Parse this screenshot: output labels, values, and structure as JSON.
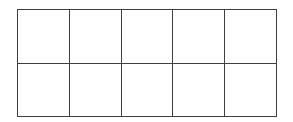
{
  "diagram": {
    "type": "grid",
    "rows": 2,
    "columns": 5,
    "line_color": "#3f3f3f",
    "background_color": "#ffffff",
    "cells": [
      [
        "",
        "",
        "",
        "",
        ""
      ],
      [
        "",
        "",
        "",
        "",
        ""
      ]
    ]
  }
}
